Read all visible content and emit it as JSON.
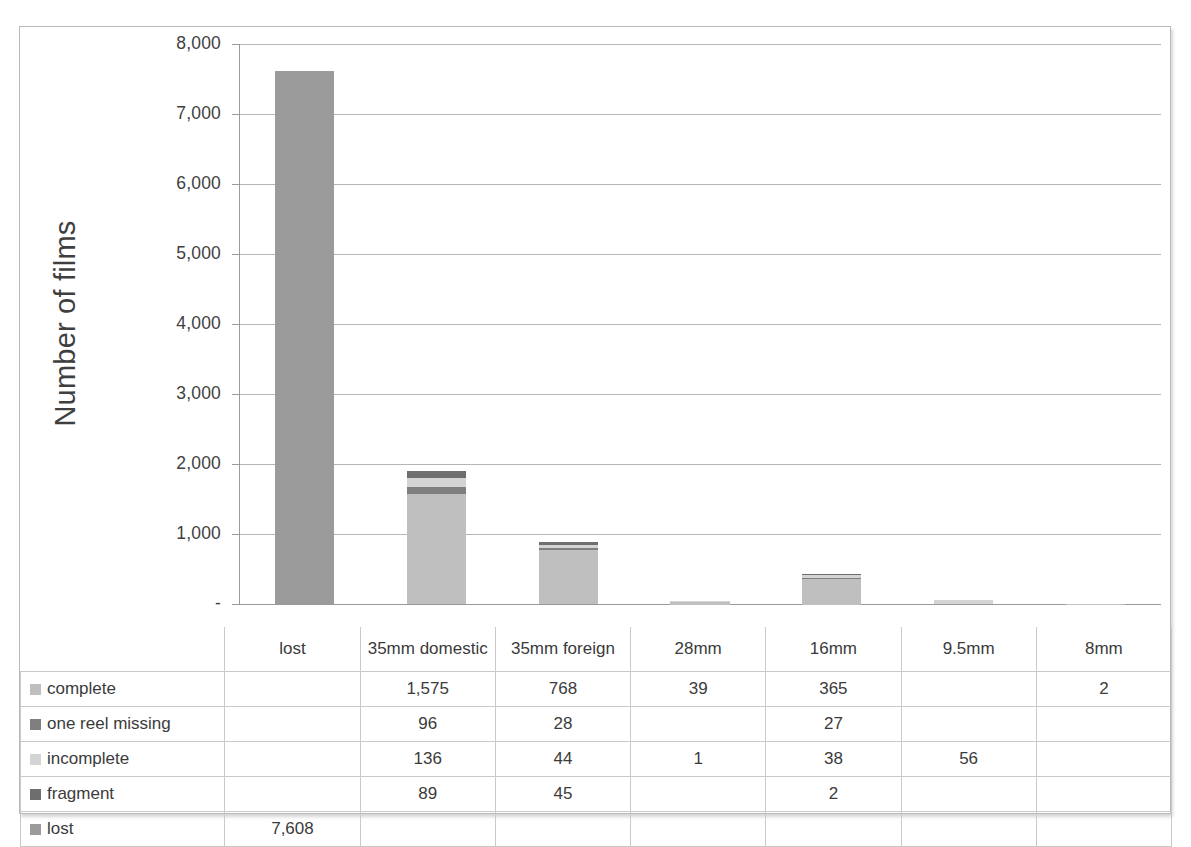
{
  "axis": {
    "y_title": "Number of films",
    "y_ticks": [
      "8,000",
      "7,000",
      "6,000",
      "5,000",
      "4,000",
      "3,000",
      "2,000",
      "1,000",
      "-"
    ],
    "y_tick_values": [
      8000,
      7000,
      6000,
      5000,
      4000,
      3000,
      2000,
      1000,
      0
    ]
  },
  "table": {
    "corner": "",
    "headers": [
      "lost",
      "35mm domestic",
      "35mm foreign",
      "28mm",
      "16mm",
      "9.5mm",
      "8mm"
    ],
    "rows": [
      {
        "label": "complete",
        "swatch": "#bfbfbf",
        "cells": [
          "",
          "1,575",
          "768",
          "39",
          "365",
          "",
          "2"
        ]
      },
      {
        "label": "one reel missing",
        "swatch": "#7f7f7f",
        "cells": [
          "",
          "96",
          "28",
          "",
          "27",
          "",
          ""
        ]
      },
      {
        "label": "incomplete",
        "swatch": "#d4d4d4",
        "cells": [
          "",
          "136",
          "44",
          "1",
          "38",
          "56",
          ""
        ]
      },
      {
        "label": "fragment",
        "swatch": "#6e6e6e",
        "cells": [
          "",
          "89",
          "45",
          "",
          "2",
          "",
          ""
        ]
      },
      {
        "label": "lost",
        "swatch": "#9b9b9b",
        "cells": [
          "7,608",
          "",
          "",
          "",
          "",
          "",
          ""
        ]
      }
    ]
  },
  "chart_data": {
    "type": "bar",
    "subtype": "stacked-column",
    "title": "",
    "xlabel": "",
    "ylabel": "Number of films",
    "ylim": [
      0,
      8000
    ],
    "ytick_step": 1000,
    "grid": true,
    "legend": "data-table",
    "categories": [
      "lost",
      "35mm domestic",
      "35mm foreign",
      "28mm",
      "16mm",
      "9.5mm",
      "8mm"
    ],
    "series": [
      {
        "name": "complete",
        "color": "#bfbfbf",
        "values": [
          0,
          1575,
          768,
          39,
          365,
          0,
          2
        ]
      },
      {
        "name": "one reel missing",
        "color": "#7f7f7f",
        "values": [
          0,
          96,
          28,
          0,
          27,
          0,
          0
        ]
      },
      {
        "name": "incomplete",
        "color": "#d4d4d4",
        "values": [
          0,
          136,
          44,
          1,
          38,
          56,
          0
        ]
      },
      {
        "name": "fragment",
        "color": "#6e6e6e",
        "values": [
          0,
          89,
          45,
          0,
          2,
          0,
          0
        ]
      },
      {
        "name": "lost",
        "color": "#9b9b9b",
        "values": [
          7608,
          0,
          0,
          0,
          0,
          0,
          0
        ]
      }
    ],
    "totals": [
      7608,
      1896,
      885,
      40,
      432,
      56,
      2
    ]
  }
}
